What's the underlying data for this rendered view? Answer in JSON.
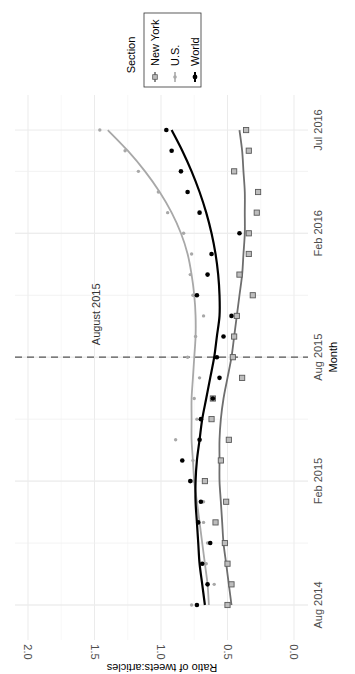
{
  "chart_data": {
    "type": "line",
    "orientation": "rotated-90-clockwise",
    "title": "",
    "xlabel": "Month",
    "ylabel": "Ratio of tweets:articles",
    "ylim": [
      0.0,
      2.0
    ],
    "yticks": [
      "0.0",
      "0.5",
      "1.0",
      "1.5",
      "2.0"
    ],
    "ytick_values": [
      0.0,
      0.5,
      1.0,
      1.5,
      2.0
    ],
    "xticks": [
      "Aug 2014",
      "Feb 2015",
      "Aug 2015",
      "Feb 2016",
      "Jul 2016"
    ],
    "xtick_month_index": [
      0,
      6,
      12,
      18,
      23
    ],
    "x": [
      "Aug 2014",
      "Sep 2014",
      "Oct 2014",
      "Nov 2014",
      "Dec 2014",
      "Jan 2015",
      "Feb 2015",
      "Mar 2015",
      "Apr 2015",
      "May 2015",
      "Jun 2015",
      "Jul 2015",
      "Aug 2015",
      "Sep 2015",
      "Oct 2015",
      "Nov 2015",
      "Dec 2015",
      "Jan 2016",
      "Feb 2016",
      "Mar 2016",
      "Apr 2016",
      "May 2016",
      "Jun 2016",
      "Jul 2016"
    ],
    "grid": true,
    "legend": {
      "title": "Section",
      "placement": "top-right",
      "entries": [
        "New York",
        "U.S.",
        "World"
      ]
    },
    "annotation": {
      "label": "August 2015",
      "month_index": 12,
      "style": "dashed-vertical-line"
    },
    "series": [
      {
        "name": "New York",
        "color": "#6e6e6e",
        "marker": "square",
        "values": [
          0.5,
          0.47,
          0.5,
          0.52,
          0.59,
          0.51,
          0.67,
          0.55,
          0.49,
          0.62,
          0.61,
          0.39,
          0.46,
          0.45,
          0.43,
          0.31,
          0.41,
          0.34,
          0.34,
          0.28,
          0.27,
          0.45,
          0.34,
          0.36
        ],
        "smooth": [
          0.47,
          0.49,
          0.51,
          0.53,
          0.54,
          0.55,
          0.56,
          0.56,
          0.56,
          0.55,
          0.53,
          0.5,
          0.47,
          0.45,
          0.43,
          0.41,
          0.39,
          0.38,
          0.37,
          0.37,
          0.37,
          0.38,
          0.39,
          0.41
        ]
      },
      {
        "name": "U.S.",
        "color": "#a8a8a8",
        "marker": "dot-small",
        "values": [
          0.77,
          0.6,
          0.66,
          0.65,
          0.68,
          0.68,
          0.76,
          0.76,
          0.89,
          0.73,
          0.75,
          0.71,
          0.8,
          0.74,
          0.68,
          0.76,
          0.78,
          0.77,
          0.83,
          0.95,
          1.02,
          1.17,
          1.27,
          1.46
        ],
        "smooth": [
          0.64,
          0.65,
          0.67,
          0.69,
          0.71,
          0.73,
          0.75,
          0.76,
          0.77,
          0.77,
          0.77,
          0.76,
          0.75,
          0.74,
          0.74,
          0.75,
          0.77,
          0.8,
          0.85,
          0.92,
          1.01,
          1.12,
          1.25,
          1.4
        ]
      },
      {
        "name": "World",
        "color": "#000000",
        "marker": "dot",
        "values": [
          0.73,
          0.65,
          0.69,
          0.63,
          0.72,
          0.7,
          0.78,
          0.84,
          0.71,
          0.7,
          0.61,
          0.56,
          0.58,
          0.53,
          0.47,
          0.73,
          0.65,
          0.62,
          0.41,
          0.71,
          0.8,
          0.85,
          0.92,
          0.96
        ],
        "smooth": [
          0.67,
          0.69,
          0.71,
          0.72,
          0.73,
          0.74,
          0.74,
          0.73,
          0.71,
          0.69,
          0.66,
          0.63,
          0.6,
          0.58,
          0.56,
          0.56,
          0.57,
          0.59,
          0.62,
          0.66,
          0.71,
          0.77,
          0.84,
          0.92
        ]
      }
    ]
  }
}
